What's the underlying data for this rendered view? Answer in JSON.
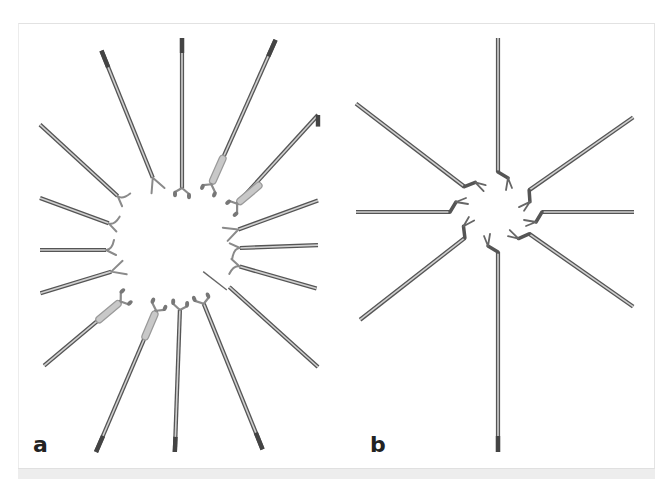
{
  "figure": {
    "panels": [
      {
        "id": "a",
        "label": "a",
        "label_pos": [
          33,
          434
        ],
        "description": "Fourteen microsurgical forceps and scissors arranged radially around a common center",
        "center": [
          182,
          250
        ],
        "instruments": [
          {
            "angle": -112,
            "outer": 215,
            "inner": 78,
            "tip": "fork"
          },
          {
            "angle": -90,
            "outer": 215,
            "inner": 62,
            "tip": "cup"
          },
          {
            "angle": -66,
            "outer": 230,
            "inner": 72,
            "tip": "cup-sheath"
          },
          {
            "angle": -40,
            "outer": 210,
            "inner": 72,
            "tip": "cup-sheath"
          },
          {
            "angle": -20,
            "outer": 145,
            "inner": 60,
            "tip": "fork"
          },
          {
            "angle": -2,
            "outer": 140,
            "inner": 58,
            "tip": "hook"
          },
          {
            "angle": 16,
            "outer": 140,
            "inner": 60,
            "tip": "hook"
          },
          {
            "angle": 38,
            "outer": 190,
            "inner": 60,
            "tip": "needle"
          },
          {
            "angle": 68,
            "outer": 215,
            "inner": 58,
            "tip": "cup"
          },
          {
            "angle": 92,
            "outer": 205,
            "inner": 60,
            "tip": "cup"
          },
          {
            "angle": 113,
            "outer": 220,
            "inner": 66,
            "tip": "cup-sheath"
          },
          {
            "angle": 140,
            "outer": 180,
            "inner": 80,
            "tip": "cup-sheath"
          },
          {
            "angle": 163,
            "outer": 148,
            "inner": 74,
            "tip": "fork"
          },
          {
            "angle": 180,
            "outer": 144,
            "inner": 76,
            "tip": "hook"
          },
          {
            "angle": -160,
            "outer": 152,
            "inner": 78,
            "tip": "hook"
          },
          {
            "angle": -140,
            "outer": 195,
            "inner": 84,
            "tip": "hook"
          }
        ]
      },
      {
        "id": "b",
        "label": "b",
        "label_pos": [
          370,
          434
        ],
        "description": "Eight angled microscissors arranged radially around a common center",
        "center": [
          498,
          212
        ],
        "instruments": [
          {
            "angle": -90,
            "outer": 175,
            "inner": 40,
            "tip": "bent-jaw"
          },
          {
            "angle": -35,
            "outer": 165,
            "inner": 38,
            "tip": "bent-jaw"
          },
          {
            "angle": 0,
            "outer": 138,
            "inner": 44,
            "tip": "bent-jaw"
          },
          {
            "angle": 35,
            "outer": 165,
            "inner": 38,
            "tip": "bent-jaw"
          },
          {
            "angle": 90,
            "outer": 242,
            "inner": 40,
            "tip": "bent-jaw"
          },
          {
            "angle": 142,
            "outer": 175,
            "inner": 42,
            "tip": "bent-jaw"
          },
          {
            "angle": 180,
            "outer": 142,
            "inner": 48,
            "tip": "bent-jaw"
          },
          {
            "angle": -143,
            "outer": 180,
            "inner": 42,
            "tip": "bent-jaw"
          }
        ]
      }
    ],
    "colors": {
      "shaft": "#8a8a8a",
      "shaft_dark": "#555555",
      "shaft_light": "#d0d0d0",
      "sheath": "#c8c8c8",
      "label": "#222222",
      "frame_border": "#e2e2e2",
      "bottom_band": "#ededed"
    }
  }
}
